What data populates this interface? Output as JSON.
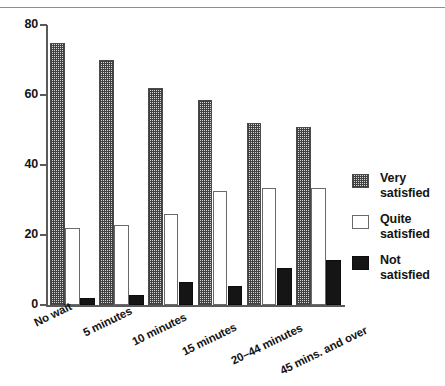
{
  "chart_data": {
    "type": "bar",
    "title": "",
    "subtitle": "",
    "xlabel": "",
    "ylabel": "",
    "ylim": [
      0,
      80
    ],
    "yticks": [
      0,
      20,
      40,
      60,
      80
    ],
    "grid": false,
    "legend_position": "right",
    "categories": [
      "No wait",
      "5 minutes",
      "10 minutes",
      "15 minutes",
      "20–44 minutes",
      "45 mins. and over"
    ],
    "series": [
      {
        "name": "Very satisfied",
        "pattern": "checkered",
        "color": "#d6d6d6",
        "values": [
          75,
          70,
          62,
          58.5,
          52,
          51
        ]
      },
      {
        "name": "Quite satisfied",
        "pattern": "white",
        "color": "#ffffff",
        "values": [
          22,
          23,
          26,
          32.5,
          33.5,
          33.5
        ]
      },
      {
        "name": "Not satisfied",
        "pattern": "solid-black",
        "color": "#151515",
        "values": [
          2,
          3,
          6.5,
          5.5,
          10.7,
          13
        ]
      }
    ]
  },
  "legend": {
    "items": [
      {
        "line1": "Very",
        "line2": "satisfied"
      },
      {
        "line1": "Quite",
        "line2": "satisfied"
      },
      {
        "line1": "Not",
        "line2": "satisfied"
      }
    ]
  }
}
